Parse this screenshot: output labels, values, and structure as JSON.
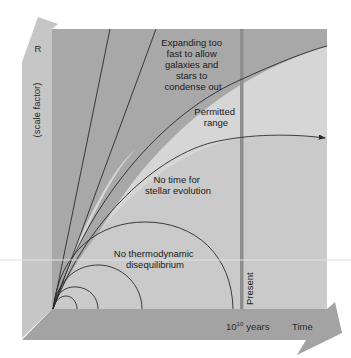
{
  "diagram": {
    "y_axis": {
      "symbol": "R",
      "label": "(scale factor)"
    },
    "x_axis": {
      "tick_base": "10",
      "tick_exponent": "10",
      "tick_unit": "years",
      "label": "Time"
    },
    "present_label": "Present",
    "regions": {
      "expanding": [
        "Expanding too",
        "fast to allow",
        "galaxies and",
        "stars to",
        "condense out"
      ],
      "permitted": [
        "Permitted",
        "range"
      ],
      "no_time": [
        "No time for",
        "stellar evolution"
      ],
      "no_thermo": [
        "No thermodynamic",
        "disequilibrium"
      ]
    },
    "colors": {
      "dark_region": "#a9a9a9",
      "light_region": "#d4d4d4",
      "axis_band": "#a2a2a2",
      "left_column": "#c4c4c4",
      "present_line": "#8c8c8c",
      "curve": "#2a2a2a"
    }
  }
}
